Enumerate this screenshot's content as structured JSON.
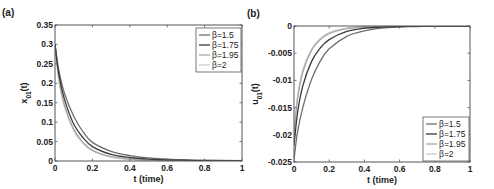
{
  "chart_data": [
    {
      "type": "line",
      "panel": "(a)",
      "title": "",
      "xlabel": "t (time)",
      "ylabel": "x_{01}(t)",
      "xlim": [
        0,
        1
      ],
      "ylim": [
        0,
        0.35
      ],
      "xticks": [
        "0",
        "0.2",
        "0.4",
        "0.6",
        "0.8",
        "1"
      ],
      "yticks": [
        "0",
        "0.05",
        "0.1",
        "0.15",
        "0.2",
        "0.25",
        "0.3",
        "0.35"
      ],
      "grid": false,
      "legend_position": "upper right",
      "x": [
        0,
        0.02,
        0.05,
        0.1,
        0.15,
        0.2,
        0.3,
        0.4,
        0.5,
        0.6,
        0.7,
        0.8,
        1.0
      ],
      "series": [
        {
          "name": "β=1.5",
          "color": "#6e6e6e",
          "values": [
            0.3,
            0.235,
            0.175,
            0.115,
            0.075,
            0.048,
            0.025,
            0.014,
            0.008,
            0.005,
            0.003,
            0.002,
            0.001
          ]
        },
        {
          "name": "β=1.75",
          "color": "#3a3a3a",
          "values": [
            0.3,
            0.225,
            0.16,
            0.095,
            0.06,
            0.037,
            0.017,
            0.009,
            0.005,
            0.003,
            0.002,
            0.001,
            0.0
          ]
        },
        {
          "name": "β=1.95",
          "color": "#a8a8a8",
          "values": [
            0.3,
            0.215,
            0.145,
            0.082,
            0.048,
            0.028,
            0.011,
            0.005,
            0.002,
            0.001,
            0.0,
            0.0,
            0.0
          ]
        },
        {
          "name": "β=2",
          "color": "#cdcdcd",
          "values": [
            0.3,
            0.21,
            0.14,
            0.078,
            0.045,
            0.026,
            0.01,
            0.004,
            0.002,
            0.001,
            0.0,
            0.0,
            0.0
          ]
        }
      ]
    },
    {
      "type": "line",
      "panel": "(b)",
      "title": "",
      "xlabel": "t (time)",
      "ylabel": "u_{01}(t)",
      "xlim": [
        0,
        1
      ],
      "ylim": [
        -0.025,
        0
      ],
      "xticks": [
        "0",
        "0.2",
        "0.4",
        "0.6",
        "0.8",
        "1"
      ],
      "yticks": [
        "-0.025",
        "-0.02",
        "-0.015",
        "-0.01",
        "-0.005",
        "0"
      ],
      "grid": false,
      "legend_position": "lower right",
      "x": [
        0,
        0.02,
        0.05,
        0.1,
        0.15,
        0.2,
        0.3,
        0.4,
        0.5,
        0.6,
        0.7,
        0.8,
        1.0
      ],
      "series": [
        {
          "name": "β=1.5",
          "color": "#6e6e6e",
          "values": [
            -0.0245,
            -0.0195,
            -0.015,
            -0.0098,
            -0.0064,
            -0.0042,
            -0.0019,
            -0.0009,
            -0.0004,
            -0.0002,
            -0.0001,
            0.0,
            0.0
          ]
        },
        {
          "name": "β=1.75",
          "color": "#3a3a3a",
          "values": [
            -0.022,
            -0.016,
            -0.011,
            -0.0065,
            -0.004,
            -0.0025,
            -0.001,
            -0.0004,
            -0.0002,
            -0.0001,
            0.0,
            0.0,
            0.0
          ]
        },
        {
          "name": "β=1.95",
          "color": "#a8a8a8",
          "values": [
            -0.02,
            -0.0135,
            -0.0085,
            -0.0045,
            -0.0025,
            -0.0014,
            -0.0005,
            -0.0002,
            -0.0001,
            0.0,
            0.0,
            0.0,
            0.0
          ]
        },
        {
          "name": "β=2",
          "color": "#cdcdcd",
          "values": [
            -0.0195,
            -0.013,
            -0.008,
            -0.0042,
            -0.0023,
            -0.0012,
            -0.0004,
            -0.0001,
            0.0,
            0.0,
            0.0,
            0.0,
            0.0
          ]
        }
      ]
    }
  ],
  "layout": {
    "panels": [
      {
        "left": 55,
        "top": 25,
        "right": 242,
        "bottom": 161,
        "legend": {
          "x": 196,
          "y": 28,
          "w": 45,
          "h": 44
        }
      },
      {
        "left": 294,
        "top": 26,
        "right": 470,
        "bottom": 162,
        "legend": {
          "x": 423,
          "y": 117,
          "w": 46,
          "h": 44
        }
      }
    ]
  }
}
